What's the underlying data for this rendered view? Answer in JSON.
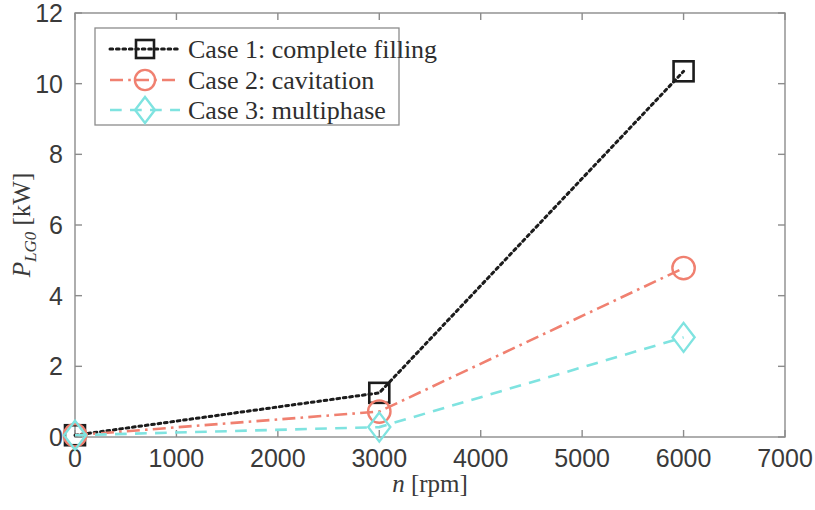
{
  "chart_data": {
    "type": "line",
    "title": "",
    "xlabel": "n [rpm]",
    "xlabel_symbol": "n",
    "xlabel_unit": "[rpm]",
    "ylabel": "P_LG0 [kW]",
    "ylabel_symbol": "P",
    "ylabel_subscript": "LG0",
    "ylabel_unit": "[kW]",
    "xlim": [
      0,
      7000
    ],
    "ylim": [
      0,
      12
    ],
    "xticks": [
      0,
      1000,
      2000,
      3000,
      4000,
      5000,
      6000,
      7000
    ],
    "yticks": [
      0,
      2,
      4,
      6,
      8,
      10,
      12
    ],
    "xtick_labels": [
      "0",
      "1000",
      "2000",
      "3000",
      "4000",
      "5000",
      "6000",
      "7000"
    ],
    "ytick_labels": [
      "0",
      "2",
      "4",
      "6",
      "8",
      "10",
      "12"
    ],
    "grid": false,
    "legend_position": "upper left",
    "x": [
      0,
      3000,
      6000
    ],
    "series": [
      {
        "name": "Case 1: complete filling",
        "values": [
          0.05,
          1.25,
          10.35
        ],
        "color": "#1c1c1c",
        "marker": "square",
        "linestyle": "dotted"
      },
      {
        "name": "Case 2: cavitation",
        "values": [
          0.05,
          0.72,
          4.78
        ],
        "color": "#f08070",
        "marker": "circle",
        "linestyle": "dashdot"
      },
      {
        "name": "Case 3: multiphase",
        "values": [
          0.05,
          0.28,
          2.82
        ],
        "color": "#7fe3e0",
        "marker": "diamond",
        "linestyle": "dashed"
      }
    ]
  },
  "legend": {
    "entries": [
      {
        "label": "Case 1: complete filling"
      },
      {
        "label": "Case 2: cavitation"
      },
      {
        "label": "Case 3: multiphase"
      }
    ]
  },
  "axes": {
    "frame_color": "#8c8c8c",
    "background": "#ffffff"
  }
}
